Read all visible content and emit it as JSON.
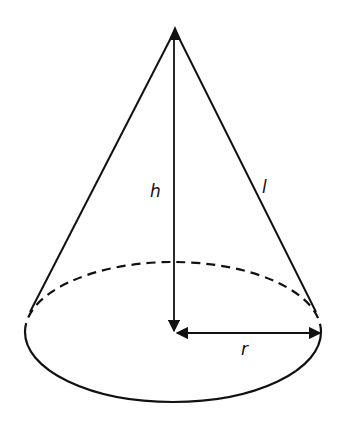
{
  "diagram": {
    "labels": {
      "height": "h",
      "slant": "l",
      "radius": "r"
    },
    "colors": {
      "stroke": "#111111",
      "background": "#ffffff"
    }
  }
}
